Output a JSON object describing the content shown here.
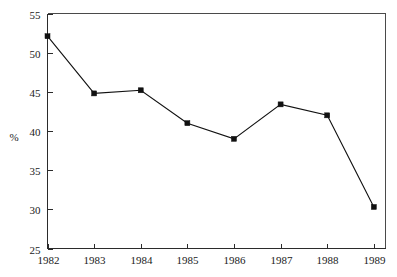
{
  "chart_data": {
    "type": "line",
    "title": "",
    "subtitle": "",
    "xlabel": "",
    "ylabel": "%",
    "categories": [
      "1982",
      "1983",
      "1984",
      "1985",
      "1986",
      "1987",
      "1988",
      "1989"
    ],
    "x": [
      1982,
      1983,
      1984,
      1985,
      1986,
      1987,
      1988,
      1989
    ],
    "values": [
      52.1,
      44.8,
      45.2,
      41.0,
      39.0,
      43.4,
      42.0,
      30.3
    ],
    "series": [
      {
        "name": "",
        "values": [
          52.1,
          44.8,
          45.2,
          41.0,
          39.0,
          43.4,
          42.0,
          30.3
        ]
      }
    ],
    "ylim": [
      25,
      55
    ],
    "ytick_labels": [
      "25",
      "30",
      "35",
      "40",
      "45",
      "50",
      "55"
    ],
    "ytick_values": [
      25,
      30,
      35,
      40,
      45,
      50,
      55
    ],
    "xtick_labels": [
      "1982",
      "1983",
      "1984",
      "1985",
      "1986",
      "1987",
      "1988",
      "1989"
    ],
    "grid": false,
    "legend": false,
    "legend_position": "none",
    "marker": "square",
    "line_color": "#111111",
    "marker_color": "#111111",
    "background_color": "#ffffff",
    "frame_color": "#4a4a4a"
  },
  "axes": {
    "y_axis_title": "%",
    "y_ticks": [
      {
        "label": "55",
        "value": 55
      },
      {
        "label": "50",
        "value": 50
      },
      {
        "label": "45",
        "value": 45
      },
      {
        "label": "40",
        "value": 40
      },
      {
        "label": "35",
        "value": 35
      },
      {
        "label": "30",
        "value": 30
      },
      {
        "label": "25",
        "value": 25
      }
    ],
    "x_ticks": [
      {
        "label": "1982",
        "value": 1982
      },
      {
        "label": "1983",
        "value": 1983
      },
      {
        "label": "1984",
        "value": 1984
      },
      {
        "label": "1985",
        "value": 1985
      },
      {
        "label": "1986",
        "value": 1986
      },
      {
        "label": "1987",
        "value": 1987
      },
      {
        "label": "1988",
        "value": 1988
      },
      {
        "label": "1989",
        "value": 1989
      }
    ]
  },
  "points": [
    {
      "x_label": "1982",
      "value": "52.1"
    },
    {
      "x_label": "1983",
      "value": "44.8"
    },
    {
      "x_label": "1984",
      "value": "45.2"
    },
    {
      "x_label": "1985",
      "value": "41.0"
    },
    {
      "x_label": "1986",
      "value": "39.0"
    },
    {
      "x_label": "1987",
      "value": "43.4"
    },
    {
      "x_label": "1988",
      "value": "42.0"
    },
    {
      "x_label": "1989",
      "value": "30.3"
    }
  ]
}
